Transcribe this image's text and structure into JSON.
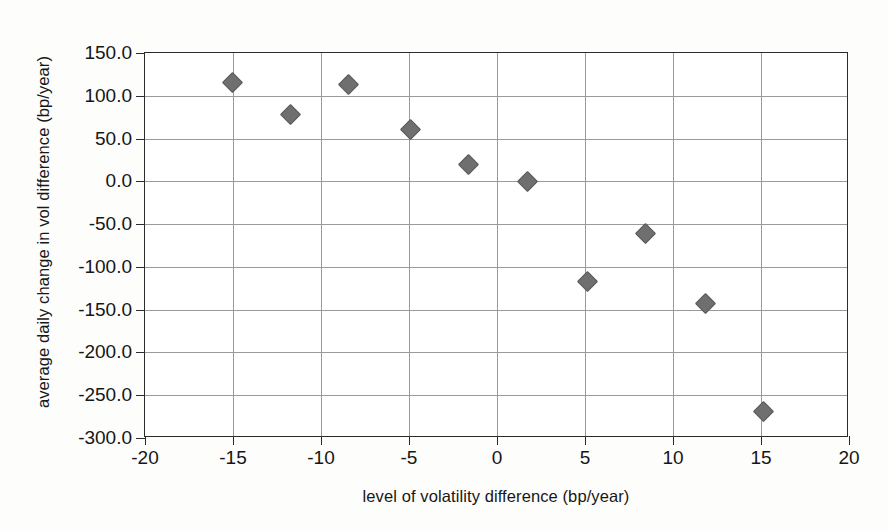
{
  "chart_data": {
    "type": "scatter",
    "title": "",
    "xlabel": "level of volatility difference (bp/year)",
    "ylabel": "average daily change in vol difference (bp/year)",
    "xlim": [
      -20,
      20
    ],
    "ylim": [
      -300,
      150
    ],
    "xticks": [
      -20,
      -15,
      -10,
      -5,
      0,
      5,
      10,
      15,
      20
    ],
    "yticks": [
      150,
      100,
      50,
      0,
      -50,
      -100,
      -150,
      -200,
      -250,
      -300
    ],
    "xticklabels": [
      "-20",
      "-15",
      "-10",
      "-5",
      "0",
      "5",
      "10",
      "15",
      "20"
    ],
    "yticklabels": [
      "150.0",
      "100.0",
      "50.0",
      "0.0",
      "-50.0",
      "-100.0",
      "-150.0",
      "-200.0",
      "-250.0",
      "-300.0"
    ],
    "grid": true,
    "legend": null,
    "marker": "diamond",
    "marker_color": "#6f6f6f",
    "series": [
      {
        "name": "average daily change vs level of volatility difference",
        "points": [
          {
            "x": -15.1,
            "y": 117.0
          },
          {
            "x": -11.8,
            "y": 79.0
          },
          {
            "x": -8.5,
            "y": 114.0
          },
          {
            "x": -5.0,
            "y": 62.0
          },
          {
            "x": -1.7,
            "y": 21.0
          },
          {
            "x": 1.7,
            "y": 1.0
          },
          {
            "x": 5.1,
            "y": -116.0
          },
          {
            "x": 8.4,
            "y": -60.0
          },
          {
            "x": 11.8,
            "y": -142.0
          },
          {
            "x": 15.1,
            "y": -268.0
          }
        ]
      }
    ]
  },
  "figure": {
    "background_color": "#fdfdfc",
    "plot_background_color": "#ffffff",
    "frame_color": "#2b2b2b",
    "gridline_color": "#9a9a9a"
  }
}
